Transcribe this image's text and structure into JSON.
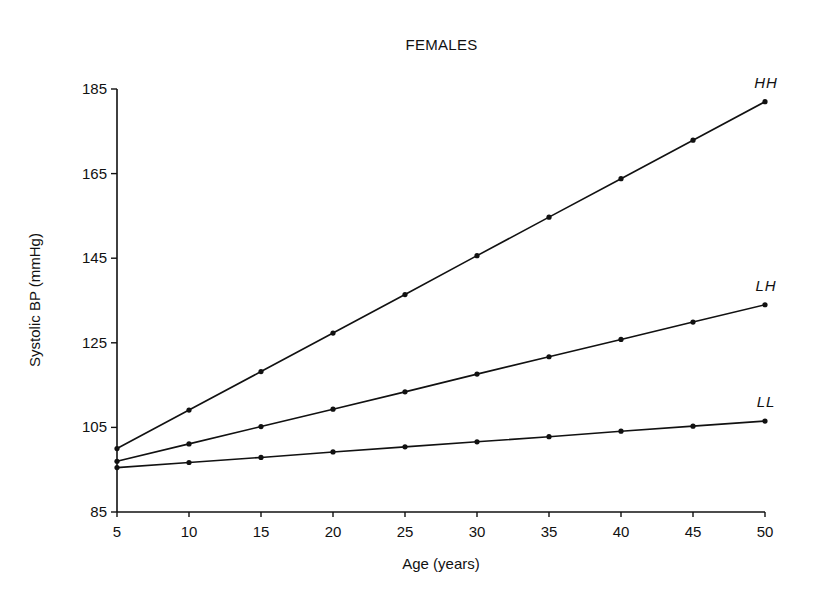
{
  "chart_data": {
    "type": "line",
    "title": "FEMALES",
    "xlabel": "Age (years)",
    "ylabel": "Systolic BP (mmHg)",
    "x": [
      5,
      10,
      15,
      20,
      25,
      30,
      35,
      40,
      45,
      50
    ],
    "xticks": [
      5,
      10,
      15,
      20,
      25,
      30,
      35,
      40,
      45,
      50
    ],
    "yticks": [
      85,
      105,
      125,
      145,
      165,
      185
    ],
    "xlim": [
      5,
      50
    ],
    "ylim": [
      85,
      185
    ],
    "grid": false,
    "legend": "inline labels at line ends (right)",
    "series": [
      {
        "name": "HH",
        "values": [
          100.0,
          109.1,
          118.2,
          127.3,
          136.4,
          145.6,
          154.7,
          163.8,
          172.9,
          182.0
        ]
      },
      {
        "name": "LH",
        "values": [
          97.0,
          101.1,
          105.2,
          109.3,
          113.4,
          117.6,
          121.7,
          125.8,
          129.9,
          134.0
        ]
      },
      {
        "name": "LL",
        "values": [
          95.5,
          96.7,
          97.9,
          99.2,
          100.4,
          101.6,
          102.8,
          104.1,
          105.3,
          106.5
        ]
      }
    ]
  }
}
